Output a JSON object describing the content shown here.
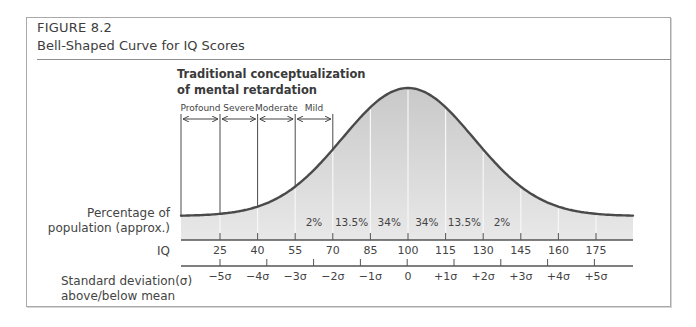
{
  "figure": {
    "number": "FIGURE 8.2",
    "title": "Bell-Shaped Curve for IQ Scores",
    "subtitle_line1": "Traditional conceptualization",
    "subtitle_line2": "of mental retardation"
  },
  "labels": {
    "percentage_line1": "Percentage of",
    "percentage_line2": "population (approx.)",
    "iq": "IQ",
    "sd_line1": "Standard deviation(σ)",
    "sd_line2": "above/below mean"
  },
  "chart_data": {
    "type": "area",
    "title": "Bell-Shaped Curve for IQ Scores",
    "subtitle": "Traditional conceptualization of mental retardation",
    "xlabel": "IQ",
    "ylabel": "Percentage of population (approx.)",
    "x_ticks": [
      25,
      40,
      55,
      70,
      85,
      100,
      115,
      130,
      145,
      160,
      175
    ],
    "sd_ticks": [
      "-5σ",
      "-4σ",
      "-3σ",
      "-2σ",
      "-1σ",
      "0",
      "+1σ",
      "+2σ",
      "+3σ",
      "+4σ",
      "+5σ"
    ],
    "mean": 100,
    "sd": 15,
    "band_percentages": [
      {
        "from": 55,
        "to": 70,
        "label": "2%"
      },
      {
        "from": 70,
        "to": 85,
        "label": "13.5%"
      },
      {
        "from": 85,
        "to": 100,
        "label": "34%"
      },
      {
        "from": 100,
        "to": 115,
        "label": "34%"
      },
      {
        "from": 115,
        "to": 130,
        "label": "13.5%"
      },
      {
        "from": 130,
        "to": 145,
        "label": "2%"
      }
    ],
    "retardation_categories": [
      {
        "label": "Profound",
        "from": 10,
        "to": 25
      },
      {
        "label": "Severe",
        "from": 25,
        "to": 40
      },
      {
        "label": "Moderate",
        "from": 40,
        "to": 55
      },
      {
        "label": "Mild",
        "from": 55,
        "to": 70
      }
    ],
    "grid": false,
    "legend": null
  }
}
